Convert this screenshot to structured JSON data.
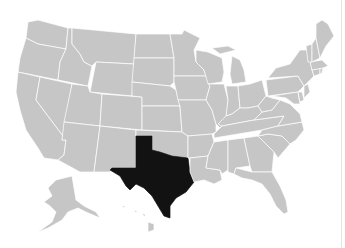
{
  "map": {
    "title": "United States map with Texas highlighted",
    "highlighted_state": "Texas",
    "colors": {
      "background": "#ffffff",
      "state_fill": "#c6c6c6",
      "state_border": "#ffffff",
      "highlight_fill": "#121212"
    },
    "states": [
      {
        "name": "Washington",
        "highlighted": false
      },
      {
        "name": "Oregon",
        "highlighted": false
      },
      {
        "name": "California",
        "highlighted": false
      },
      {
        "name": "Idaho",
        "highlighted": false
      },
      {
        "name": "Nevada",
        "highlighted": false
      },
      {
        "name": "Montana",
        "highlighted": false
      },
      {
        "name": "Wyoming",
        "highlighted": false
      },
      {
        "name": "Utah",
        "highlighted": false
      },
      {
        "name": "Arizona",
        "highlighted": false
      },
      {
        "name": "Colorado",
        "highlighted": false
      },
      {
        "name": "New Mexico",
        "highlighted": false
      },
      {
        "name": "North Dakota",
        "highlighted": false
      },
      {
        "name": "South Dakota",
        "highlighted": false
      },
      {
        "name": "Nebraska",
        "highlighted": false
      },
      {
        "name": "Kansas",
        "highlighted": false
      },
      {
        "name": "Oklahoma",
        "highlighted": false
      },
      {
        "name": "Texas",
        "highlighted": true
      },
      {
        "name": "Minnesota",
        "highlighted": false
      },
      {
        "name": "Iowa",
        "highlighted": false
      },
      {
        "name": "Missouri",
        "highlighted": false
      },
      {
        "name": "Arkansas",
        "highlighted": false
      },
      {
        "name": "Louisiana",
        "highlighted": false
      },
      {
        "name": "Wisconsin",
        "highlighted": false
      },
      {
        "name": "Illinois",
        "highlighted": false
      },
      {
        "name": "Michigan",
        "highlighted": false
      },
      {
        "name": "Indiana",
        "highlighted": false
      },
      {
        "name": "Ohio",
        "highlighted": false
      },
      {
        "name": "Kentucky",
        "highlighted": false
      },
      {
        "name": "Tennessee",
        "highlighted": false
      },
      {
        "name": "Mississippi",
        "highlighted": false
      },
      {
        "name": "Alabama",
        "highlighted": false
      },
      {
        "name": "Georgia",
        "highlighted": false
      },
      {
        "name": "Florida",
        "highlighted": false
      },
      {
        "name": "South Carolina",
        "highlighted": false
      },
      {
        "name": "North Carolina",
        "highlighted": false
      },
      {
        "name": "Virginia",
        "highlighted": false
      },
      {
        "name": "West Virginia",
        "highlighted": false
      },
      {
        "name": "Pennsylvania",
        "highlighted": false
      },
      {
        "name": "New York",
        "highlighted": false
      },
      {
        "name": "Maryland",
        "highlighted": false
      },
      {
        "name": "Delaware",
        "highlighted": false
      },
      {
        "name": "New Jersey",
        "highlighted": false
      },
      {
        "name": "Connecticut",
        "highlighted": false
      },
      {
        "name": "Rhode Island",
        "highlighted": false
      },
      {
        "name": "Massachusetts",
        "highlighted": false
      },
      {
        "name": "Vermont",
        "highlighted": false
      },
      {
        "name": "New Hampshire",
        "highlighted": false
      },
      {
        "name": "Maine",
        "highlighted": false
      },
      {
        "name": "Alaska",
        "highlighted": false
      },
      {
        "name": "Hawaii",
        "highlighted": false
      }
    ]
  }
}
